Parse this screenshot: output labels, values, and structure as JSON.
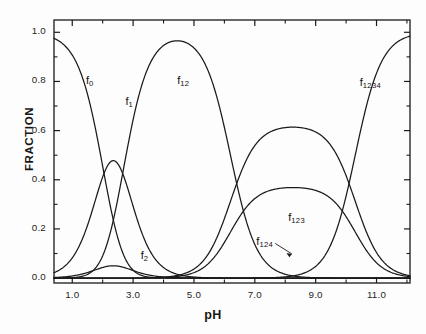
{
  "chart_data": {
    "type": "line",
    "title": "",
    "xlabel": "pH",
    "ylabel": "FRACTION",
    "xlim": [
      0.4,
      12.1
    ],
    "ylim": [
      -0.02,
      1.05
    ],
    "grid": false,
    "legend_position": "inline-curve-labels",
    "x_ticks_major": [
      1.0,
      3.0,
      5.0,
      7.0,
      9.0,
      11.0
    ],
    "x_tick_labels": [
      "1.0",
      "3.0",
      "5.0",
      "7.0",
      "9.0",
      "11.0"
    ],
    "x_ticks_minor": [
      2.0,
      4.0,
      6.0,
      8.0,
      10.0,
      12.0
    ],
    "y_ticks_major": [
      0.0,
      0.2,
      0.4,
      0.6,
      0.8,
      1.0
    ],
    "y_tick_labels": [
      "0.0",
      "0.2",
      "0.4",
      "0.6",
      "0.8",
      "1.0"
    ],
    "y_ticks_minor": [
      0.1,
      0.3,
      0.5,
      0.7,
      0.9
    ],
    "model": "polyprotic acid fractional composition",
    "pKa": [
      2.0,
      2.7,
      6.2,
      10.3
    ],
    "series": [
      {
        "name": "f0",
        "label": "f0",
        "label_text": "f",
        "label_sub": "0",
        "label_x": 1.45,
        "label_y": 0.8,
        "peak_x": 0.4,
        "peak_y": 1.0,
        "description": "fully protonated form, dominant below pH 2"
      },
      {
        "name": "f1",
        "label": "f1",
        "label_text": "f",
        "label_sub": "1",
        "label_x": 2.75,
        "label_y": 0.715,
        "peak_x": 2.75,
        "peak_y": 0.64,
        "description": "singly deprotonated, peaks near pH 2.75"
      },
      {
        "name": "f12",
        "label": "f12",
        "label_text": "f",
        "label_sub": "12",
        "label_x": 4.45,
        "label_y": 0.8,
        "peak_x": 6.0,
        "peak_y": 1.0,
        "description": "doubly deprotonated, plateau pH 4.5-8"
      },
      {
        "name": "f123",
        "label": "f123",
        "label_text": "f",
        "label_sub": "123",
        "label_x": 8.1,
        "label_y": 0.245,
        "peak_x": 9.1,
        "peak_y": 0.35,
        "description": "triply deprotonated, peaks near pH 9.1"
      },
      {
        "name": "f124",
        "label": "f124",
        "label_text": "f",
        "label_sub": "124",
        "label_x": 7.05,
        "label_y": 0.145,
        "peak_x": 9.1,
        "peak_y": 0.21,
        "leader_line": true,
        "description": "alternate triply deprotonated tautomer"
      },
      {
        "name": "f1234",
        "label": "f1234",
        "label_text": "f",
        "label_sub": "1234",
        "label_x": 10.45,
        "label_y": 0.795,
        "peak_x": 12.1,
        "peak_y": 1.0,
        "description": "fully deprotonated, dominant above pH 11"
      },
      {
        "name": "f2",
        "label": "f2",
        "label_text": "f",
        "label_sub": "2",
        "label_x": 3.25,
        "label_y": 0.088,
        "peak_x": 2.75,
        "peak_y": 0.068,
        "description": "minor tautomer, low broad peak near pH 2.8"
      }
    ],
    "colors": {
      "curve": "#1a1a1a",
      "axis": "#1a1a1a",
      "background": "#fdfdfd"
    }
  }
}
